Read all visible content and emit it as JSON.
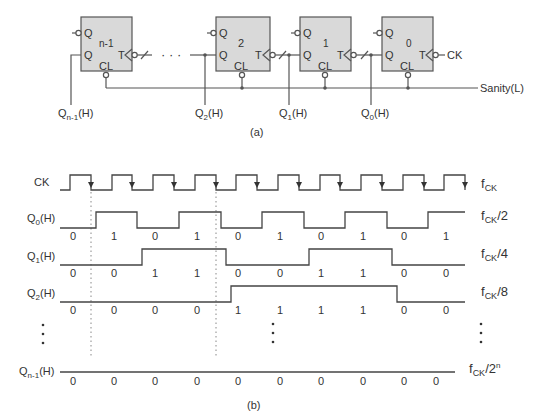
{
  "part_a": {
    "caption": "(a)",
    "flipflops": [
      {
        "id": "n-1",
        "label": "n-1",
        "q_bar": "Q",
        "q": "Q",
        "t": "T",
        "cl": "CL"
      },
      {
        "id": "2",
        "label": "2",
        "q_bar": "Q",
        "q": "Q",
        "t": "T",
        "cl": "CL"
      },
      {
        "id": "1",
        "label": "1",
        "q_bar": "Q",
        "q": "Q",
        "t": "T",
        "cl": "CL"
      },
      {
        "id": "0",
        "label": "0",
        "q_bar": "Q",
        "q": "Q",
        "t": "T",
        "cl": "CL"
      }
    ],
    "ellipsis": "· · ·",
    "clock_input": "CK",
    "sanity_label": "Sanity(L)",
    "outputs": [
      {
        "base": "Q",
        "sub": "n-1",
        "suffix": "(H)"
      },
      {
        "base": "Q",
        "sub": "2",
        "suffix": "(H)"
      },
      {
        "base": "Q",
        "sub": "1",
        "suffix": "(H)"
      },
      {
        "base": "Q",
        "sub": "0",
        "suffix": "(H)"
      }
    ]
  },
  "part_b": {
    "caption": "(b)",
    "clock_label": "CK",
    "signals": [
      {
        "base": "Q",
        "sub": "0",
        "suffix": "(H)",
        "freq_base": "f",
        "freq_sub": "CK",
        "freq_div": "/2",
        "values": [
          "0",
          "1",
          "0",
          "1",
          "0",
          "1",
          "0",
          "1",
          "0",
          "1"
        ]
      },
      {
        "base": "Q",
        "sub": "1",
        "suffix": "(H)",
        "freq_base": "f",
        "freq_sub": "CK",
        "freq_div": "/4",
        "values": [
          "0",
          "0",
          "1",
          "1",
          "0",
          "0",
          "1",
          "1",
          "0",
          "0"
        ]
      },
      {
        "base": "Q",
        "sub": "2",
        "suffix": "(H)",
        "freq_base": "f",
        "freq_sub": "CK",
        "freq_div": "/8",
        "values": [
          "0",
          "0",
          "0",
          "0",
          "1",
          "1",
          "1",
          "1",
          "0",
          "0"
        ]
      },
      {
        "base": "Q",
        "sub": "n-1",
        "suffix": "(H)",
        "freq_base": "f",
        "freq_sub": "CK",
        "freq_div": "/2",
        "freq_sup": "n",
        "values": [
          "0",
          "0",
          "0",
          "0",
          "0",
          "0",
          "0",
          "0",
          "0",
          "0"
        ]
      }
    ],
    "clock_freq": {
      "base": "f",
      "sub": "CK"
    },
    "vertical_ellipsis": "⋮"
  }
}
